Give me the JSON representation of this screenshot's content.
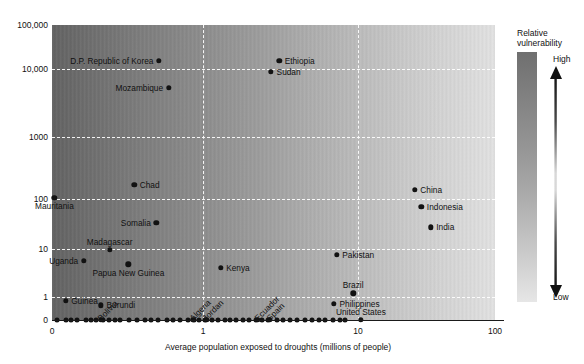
{
  "chart_data": {
    "type": "scatter",
    "title": "",
    "xlabel": "Average population exposed to droughts (millions of people)",
    "ylabel": "",
    "xscale": "log",
    "yscale": "log",
    "xticks": [
      "0",
      "1",
      "10",
      "100"
    ],
    "yticks": [
      "100,000",
      "10,000",
      "1000",
      "100",
      "10",
      "1",
      "0"
    ],
    "grid": "dashed white gridlines at each tick",
    "background": "horizontal grayscale gradient, dark (left) to light (right)",
    "legend": {
      "position": "right",
      "title_line1": "Relative",
      "title_line2": "vulnerability",
      "high_label": "High",
      "low_label": "Low",
      "arrow": "double-headed vertical arrow",
      "gradient_top": "#6f6f6f",
      "gradient_bottom": "#e6e6e6"
    },
    "points": [
      {
        "name": "D.P. Republic of Korea",
        "x": 0.52,
        "y": 15000,
        "label_pos": "left"
      },
      {
        "name": "Ethiopia",
        "x": 3.1,
        "y": 15000,
        "label_pos": "right"
      },
      {
        "name": "Sudan",
        "x": 2.75,
        "y": 9000,
        "label_pos": "right"
      },
      {
        "name": "Mozambique",
        "x": 0.6,
        "y": 5200,
        "label_pos": "left"
      },
      {
        "name": "Chad",
        "x": 0.36,
        "y": 170,
        "label_pos": "right"
      },
      {
        "name": "China",
        "x": 26,
        "y": 140,
        "label_pos": "right"
      },
      {
        "name": "Mauritania",
        "x": 0.11,
        "y": 105,
        "label_pos": "below"
      },
      {
        "name": "Indonesia",
        "x": 29,
        "y": 70,
        "label_pos": "right"
      },
      {
        "name": "Somalia",
        "x": 0.5,
        "y": 33,
        "label_pos": "left"
      },
      {
        "name": "India",
        "x": 34,
        "y": 27,
        "label_pos": "right"
      },
      {
        "name": "Madagascar",
        "x": 0.25,
        "y": 9.5,
        "label_pos": "above"
      },
      {
        "name": "Pakistan",
        "x": 7.3,
        "y": 7.5,
        "label_pos": "right"
      },
      {
        "name": "Uganda",
        "x": 0.17,
        "y": 5.6,
        "label_pos": "left"
      },
      {
        "name": "Papua New Guinea",
        "x": 0.33,
        "y": 4.8,
        "label_pos": "below"
      },
      {
        "name": "Kenya",
        "x": 1.3,
        "y": 4.0,
        "label_pos": "right"
      },
      {
        "name": "Brazil",
        "x": 9.3,
        "y": 1.2,
        "label_pos": "above"
      },
      {
        "name": "Guinea",
        "x": 0.13,
        "y": 0.58,
        "label_pos": "right"
      },
      {
        "name": "Philippines",
        "x": 7.0,
        "y": 0.4,
        "label_pos": "right"
      },
      {
        "name": "Burundi",
        "x": 0.22,
        "y": 0.32,
        "label_pos": "right"
      },
      {
        "name": "Bolivia",
        "x": 0.22,
        "y": 0,
        "label_pos": "rot"
      },
      {
        "name": "Algeria",
        "x": 0.86,
        "y": 0,
        "label_pos": "rot"
      },
      {
        "name": "Jordan",
        "x": 1.05,
        "y": 0,
        "label_pos": "rot"
      },
      {
        "name": "Ecuador",
        "x": 2.25,
        "y": 0,
        "label_pos": "rot"
      },
      {
        "name": "Spain",
        "x": 2.7,
        "y": 0,
        "label_pos": "rot"
      },
      {
        "name": "United States",
        "x": 10.5,
        "y": 0,
        "label_pos": "above"
      }
    ],
    "unlabeled_baseline_x_px": [
      57,
      66,
      71,
      77,
      86,
      91,
      96,
      103,
      109,
      115,
      120,
      129,
      137,
      145,
      151,
      158,
      167,
      173,
      180,
      188,
      194,
      199,
      205,
      212,
      218,
      225,
      230,
      236,
      243,
      249,
      256,
      262,
      268,
      277,
      283,
      290,
      297,
      305,
      312,
      319,
      325,
      333,
      340,
      345
    ],
    "note": "Each dot is one country; darker background region indicates higher relative vulnerability."
  }
}
